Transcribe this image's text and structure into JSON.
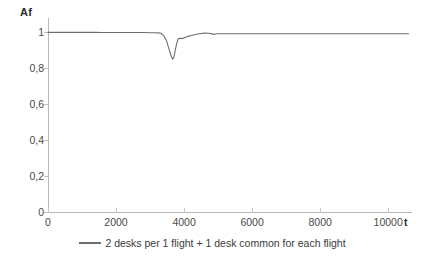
{
  "chart_data": {
    "type": "line",
    "title": "",
    "xlabel": "t",
    "ylabel": "Af",
    "xlim": [
      0,
      10700
    ],
    "ylim": [
      0,
      1.08
    ],
    "grid": false,
    "legend_position": "bottom-center",
    "x_ticks": [
      0,
      2000,
      4000,
      6000,
      8000,
      10000
    ],
    "x_tick_labels": [
      "0",
      "2000",
      "4000",
      "6000",
      "8000",
      "10000"
    ],
    "y_ticks": [
      0,
      0.2,
      0.4,
      0.6,
      0.8,
      1
    ],
    "y_tick_labels": [
      "0",
      "0,2",
      "0,4",
      "0,6",
      "0,8",
      "1"
    ],
    "series": [
      {
        "name": "2 desks per 1 flight + 1 desk common for each flight",
        "color": "#6e6e6e",
        "x": [
          0,
          200,
          400,
          600,
          800,
          1000,
          1200,
          1400,
          1600,
          1800,
          2000,
          2200,
          2400,
          2600,
          2800,
          3000,
          3150,
          3250,
          3320,
          3400,
          3480,
          3560,
          3620,
          3660,
          3700,
          3740,
          3780,
          3820,
          3860,
          3900,
          3980,
          4060,
          4140,
          4220,
          4300,
          4400,
          4500,
          4600,
          4700,
          4800,
          4860,
          4900,
          4960,
          5040,
          5200,
          5400,
          5600,
          6000,
          6400,
          6800,
          7200,
          7600,
          8000,
          8400,
          8800,
          9200,
          9600,
          10000,
          10400,
          10600
        ],
        "y": [
          1.0,
          1.0,
          1.0,
          1.0,
          1.0,
          1.0,
          1.0,
          1.0,
          0.999,
          0.999,
          0.999,
          0.999,
          0.999,
          0.999,
          0.999,
          0.998,
          0.998,
          0.997,
          0.995,
          0.982,
          0.955,
          0.905,
          0.868,
          0.851,
          0.862,
          0.9,
          0.935,
          0.962,
          0.968,
          0.965,
          0.968,
          0.974,
          0.979,
          0.983,
          0.987,
          0.991,
          0.994,
          0.996,
          0.995,
          0.993,
          0.989,
          0.99,
          0.992,
          0.992,
          0.992,
          0.992,
          0.992,
          0.992,
          0.992,
          0.992,
          0.992,
          0.992,
          0.992,
          0.992,
          0.992,
          0.992,
          0.992,
          0.992,
          0.992,
          0.992
        ]
      }
    ]
  },
  "axes": {
    "y_title": "Af",
    "x_title": "t"
  },
  "legend": {
    "items": [
      {
        "label": "2 desks per 1 flight + 1 desk common for each flight",
        "color": "#6e6e6e"
      }
    ]
  },
  "colors": {
    "series": "#6e6e6e",
    "axis": "#b8b8b8",
    "text": "#3a3a3a",
    "background": "#ffffff"
  }
}
